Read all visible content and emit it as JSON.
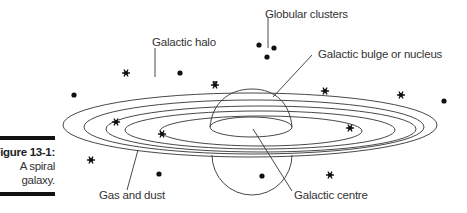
{
  "figure": {
    "number_label": "Figure 13-1:",
    "caption_line1": "A spiral",
    "caption_line2": "galaxy."
  },
  "labels": {
    "globular_clusters": "Globular clusters",
    "galactic_halo": "Galactic halo",
    "galactic_bulge": "Galactic bulge or nucleus",
    "gas_and_dust": "Gas and dust",
    "galactic_centre": "Galactic centre"
  },
  "colors": {
    "line": "#333333",
    "ink": "#111111",
    "background": "#ffffff"
  },
  "symbols": {
    "dot": "globular-cluster-dot",
    "star": "star-asterisk"
  }
}
